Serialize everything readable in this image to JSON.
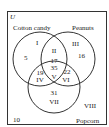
{
  "diagram": {
    "type": "venn",
    "universe_label": "U",
    "sets": [
      {
        "name": "Cotton candy"
      },
      {
        "name": "Peanuts"
      },
      {
        "name": "Popcorn"
      }
    ],
    "regions": [
      {
        "roman": "I",
        "value": "5"
      },
      {
        "roman": "II",
        "value": "17"
      },
      {
        "roman": "III",
        "value": "16"
      },
      {
        "roman": "IV",
        "value": "19"
      },
      {
        "roman": "V",
        "value": "35"
      },
      {
        "roman": "VI",
        "value": "22"
      },
      {
        "roman": "VII",
        "value": "31"
      },
      {
        "roman": "VIII",
        "value": "10"
      }
    ],
    "colors": {
      "line": "#333333",
      "text": "#222222",
      "background": "#ffffff"
    }
  }
}
